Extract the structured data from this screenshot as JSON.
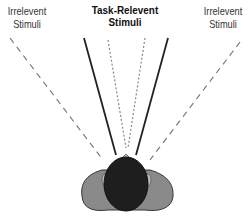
{
  "title": "Task-Relevent Stimuli",
  "left_label": {
    "line1": "Irrelevent",
    "line2": "Stimuli"
  },
  "right_label": {
    "line1": "Irrelevent",
    "line2": "Stimuli"
  },
  "colors": {
    "solid_line": "#222222",
    "dashed_line": "#777777",
    "dotted_line": "#888888",
    "head": "#1e1e1e",
    "shoulders": "#8a8a8a",
    "shoulder_outline": "#333333",
    "nose": "#bdbdbd"
  }
}
